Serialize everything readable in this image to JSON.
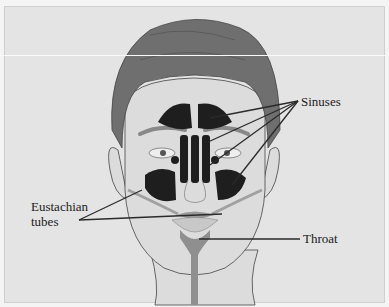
{
  "diagram": {
    "labels": {
      "sinuses": "Sinuses",
      "eustachian_line1": "Eustachian",
      "eustachian_line2": "tubes",
      "throat": "Throat"
    },
    "colors": {
      "background": "#e4e4e4",
      "skin": "#dcdcdc",
      "hair": "#6f6f6f",
      "sinus": "#1e1e1e",
      "throat": "#8f8f8f",
      "leader_line": "#2a2a2a"
    }
  }
}
